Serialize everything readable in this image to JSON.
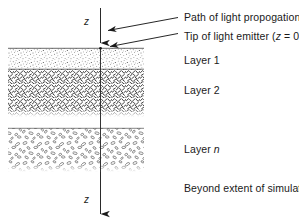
{
  "figure": {
    "background_color": "#ffffff",
    "ink_color": "#1a1a1a",
    "width": 299,
    "height": 224
  },
  "axis": {
    "name": "z-axis",
    "label_top": "z",
    "label_bottom": "z",
    "direction": "downward",
    "x_position": 100,
    "top_y": 8,
    "bottom_y": 219,
    "surface_arrowhead_y": 48,
    "description": "Vertical depth axis z increasing downward"
  },
  "annotations": [
    {
      "id": "path-of-light",
      "text": "Path of light propogation",
      "target": "z-axis line",
      "arrow_from": [
        178,
        18
      ],
      "arrow_to": [
        104,
        31
      ]
    },
    {
      "id": "tip-of-emitter",
      "text": "Tip of light emitter (z = 0)",
      "text_plain": "Tip of light emitter (z = 0)",
      "text_prefix": "Tip of light emitter (",
      "text_italic": "z",
      "text_suffix": " = 0)",
      "target": "surface intersection",
      "arrow_from": [
        178,
        33
      ],
      "arrow_to": [
        106,
        47
      ]
    },
    {
      "id": "beyond-extent",
      "text": "Beyond extent of simulation",
      "target": "region below final layer"
    }
  ],
  "layers": [
    {
      "id": "layer-1",
      "label_prefix": "Layer ",
      "label_suffix": "1",
      "label": "Layer 1",
      "texture": "fine-stipple-dots",
      "x": 8,
      "y": 48,
      "width": 136,
      "height": 21,
      "fill": "#fdfdfd"
    },
    {
      "id": "layer-2",
      "label_prefix": "Layer ",
      "label_suffix": "2",
      "label": "Layer 2",
      "texture": "dense-diagonal-dashes",
      "x": 8,
      "y": 69,
      "width": 136,
      "height": 48,
      "fill": "#ffffff"
    },
    {
      "id": "layer-n",
      "label_prefix": "Layer ",
      "label_suffix": "n",
      "label": "Layer n",
      "label_italic_part": "n",
      "texture": "sparse-ellipse-outlines",
      "x": 8,
      "y": 128,
      "width": 136,
      "height": 44,
      "fill": "#ffffff"
    }
  ],
  "label_positions": {
    "path_of_light": {
      "x": 184,
      "y": 14
    },
    "tip_of_emitter": {
      "x": 184,
      "y": 33
    },
    "layer_1": {
      "x": 184,
      "y": 56
    },
    "layer_2": {
      "x": 184,
      "y": 86
    },
    "layer_n": {
      "x": 184,
      "y": 145
    },
    "beyond_extent": {
      "x": 184,
      "y": 184
    },
    "z_top": {
      "x": 84,
      "y": 18
    },
    "z_bottom": {
      "x": 84,
      "y": 196
    }
  },
  "boundaries": {
    "surface_line_y": 48,
    "layer1_layer2_y": 69,
    "layer2_bottom_y": 117,
    "layern_top_y": 128,
    "layern_bottom_y": 172
  }
}
